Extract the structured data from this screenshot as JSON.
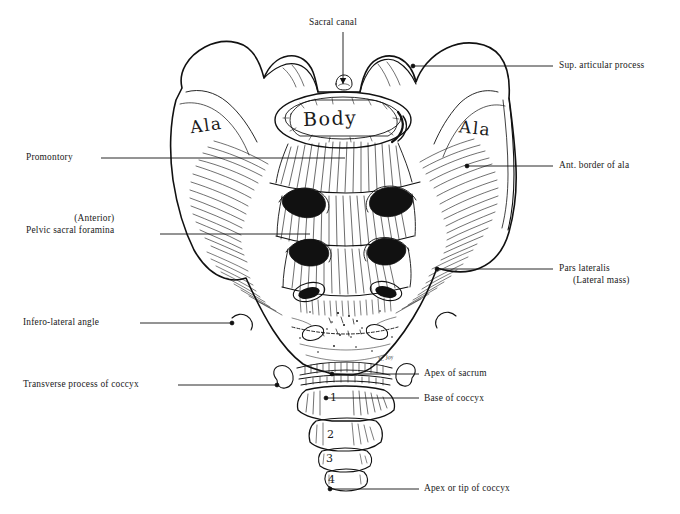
{
  "figure": {
    "background": "#ffffff",
    "ink": "#111111",
    "signature": "N. Joy"
  },
  "bone_labels": [
    {
      "name": "ala-left",
      "text": "Ala",
      "x": 190,
      "y": 115,
      "size": 17,
      "rotate": -8
    },
    {
      "name": "body",
      "text": "Body",
      "x": 303,
      "y": 107,
      "size": 19,
      "rotate": -2
    },
    {
      "name": "ala-right",
      "text": "Ala",
      "x": 459,
      "y": 118,
      "size": 17,
      "rotate": 6
    }
  ],
  "coccyx_segments": [
    {
      "name": "coccyx-segment-1",
      "text": "1",
      "x": 330,
      "y": 391,
      "size": 11
    },
    {
      "name": "coccyx-segment-2",
      "text": "2",
      "x": 327,
      "y": 428,
      "size": 11
    },
    {
      "name": "coccyx-segment-3",
      "text": "3",
      "x": 326,
      "y": 452,
      "size": 11
    },
    {
      "name": "coccyx-segment-4",
      "text": "4",
      "x": 328,
      "y": 473,
      "size": 11
    }
  ],
  "callouts": [
    {
      "name": "callout-sacral-canal",
      "label": "Sacral canal",
      "side": "top",
      "text_x": 309,
      "text_y": 17,
      "line": [
        [
          343,
          32
        ],
        [
          343,
          84
        ]
      ],
      "arrow": true,
      "dot": false
    },
    {
      "name": "callout-sup-articular-process",
      "label": "Sup. articular process",
      "side": "right",
      "text_x": 559,
      "text_y": 60,
      "line": [
        [
          553,
          66
        ],
        [
          413,
          66
        ]
      ],
      "arrow": false,
      "dot": true
    },
    {
      "name": "callout-ant-border-of-ala",
      "label": "Ant. border of ala",
      "side": "right",
      "text_x": 559,
      "text_y": 160,
      "line": [
        [
          553,
          166
        ],
        [
          467,
          166
        ]
      ],
      "arrow": false,
      "dot": true
    },
    {
      "name": "callout-pars-lateralis",
      "label": "Pars lateralis",
      "label2": "(Lateral mass)",
      "side": "right",
      "text_x": 559,
      "text_y": 263,
      "line": [
        [
          553,
          269
        ],
        [
          437,
          269
        ]
      ],
      "arrow": false,
      "dot": true
    },
    {
      "name": "callout-apex-of-sacrum",
      "label": "Apex of sacrum",
      "side": "right",
      "text_x": 424,
      "text_y": 368,
      "line": [
        [
          419,
          374
        ],
        [
          332,
          374
        ]
      ],
      "arrow": false,
      "dot": true
    },
    {
      "name": "callout-base-of-coccyx",
      "label": "Base of coccyx",
      "side": "right",
      "text_x": 424,
      "text_y": 393,
      "line": [
        [
          419,
          398
        ],
        [
          326,
          398
        ]
      ],
      "arrow": false,
      "dot": true
    },
    {
      "name": "callout-apex-or-tip-of-coccyx",
      "label": "Apex or tip of coccyx",
      "side": "right",
      "text_x": 424,
      "text_y": 483,
      "line": [
        [
          419,
          489
        ],
        [
          330,
          489
        ]
      ],
      "arrow": false,
      "dot": true
    },
    {
      "name": "callout-promontory",
      "label": "Promontory",
      "side": "left",
      "text_x": 26,
      "text_y": 152,
      "line": [
        [
          101,
          158
        ],
        [
          345,
          158
        ]
      ],
      "arrow": false,
      "dot": false
    },
    {
      "name": "callout-pelvic-sacral-foramina",
      "label": "(Anterior)",
      "label2": "  Pelvic sacral foramina",
      "side": "left",
      "text_x": 21,
      "text_y": 213,
      "line": [
        [
          160,
          234
        ],
        [
          310,
          234
        ]
      ],
      "arrow": false,
      "dot": false
    },
    {
      "name": "callout-infero-lateral-angle",
      "label": "Infero-lateral angle",
      "side": "left",
      "text_x": 23,
      "text_y": 317,
      "line": [
        [
          140,
          323
        ],
        [
          232,
          323
        ]
      ],
      "arrow": false,
      "dot": true
    },
    {
      "name": "callout-transverse-process-of-coccyx",
      "label": "Transverse process of coccyx",
      "side": "left",
      "text_x": 23,
      "text_y": 379,
      "line": [
        [
          178,
          385
        ],
        [
          277,
          385
        ]
      ],
      "arrow": false,
      "dot": true
    }
  ]
}
